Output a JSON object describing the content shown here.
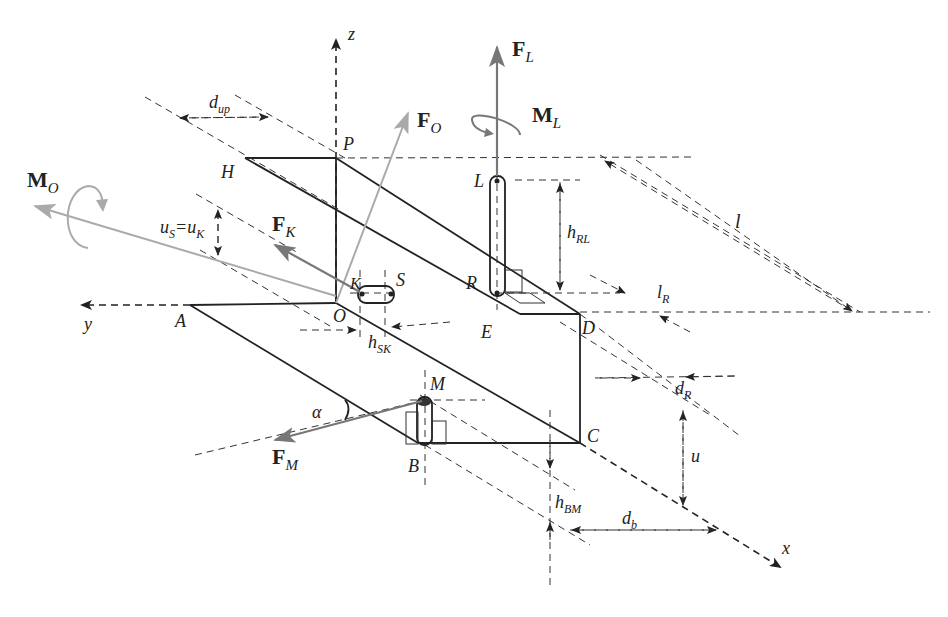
{
  "diagram": {
    "type": "mechanical free-body diagram",
    "axes": {
      "x": "x",
      "y": "y",
      "z": "z"
    },
    "points": [
      "A",
      "B",
      "C",
      "D",
      "E",
      "H",
      "K",
      "L",
      "M",
      "O",
      "P",
      "R",
      "S"
    ],
    "forces": {
      "F_L": {
        "main": "F",
        "sub": "L"
      },
      "F_O": {
        "main": "F",
        "sub": "O"
      },
      "F_K": {
        "main": "F",
        "sub": "K"
      },
      "F_M": {
        "main": "F",
        "sub": "M"
      }
    },
    "moments": {
      "M_L": {
        "main": "M",
        "sub": "L"
      },
      "M_O": {
        "main": "M",
        "sub": "O"
      }
    },
    "dimensions": {
      "d_up": {
        "main": "d",
        "sub": "up"
      },
      "l": {
        "main": "l"
      },
      "h_RL": {
        "main": "h",
        "sub": "RL"
      },
      "l_R": {
        "main": "l",
        "sub": "R"
      },
      "d_R": {
        "main": "d",
        "sub": "R"
      },
      "u": {
        "main": "u"
      },
      "d_b": {
        "main": "d",
        "sub": "b"
      },
      "h_BM": {
        "main": "h",
        "sub": "BM"
      },
      "h_SK": {
        "main": "h",
        "sub": "SK"
      },
      "uS_uK": {
        "a": "u",
        "asub": "S",
        "eq": "=",
        "b": "u",
        "bsub": "K"
      }
    },
    "angle": {
      "alpha": "α"
    },
    "colors": {
      "structure": "#222222",
      "force_dark": "#777777",
      "force_light": "#aaaaaa"
    }
  }
}
